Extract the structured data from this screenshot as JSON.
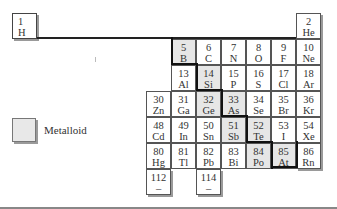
{
  "legend": {
    "label": "Metalloid",
    "color": "#e6e6e6"
  },
  "hydrogen": {
    "number": "1",
    "symbol": "H"
  },
  "elements": [
    {
      "number": "2",
      "symbol": "He",
      "col": 6,
      "row": 0,
      "metalloid": false
    },
    {
      "number": "5",
      "symbol": "B",
      "col": 1,
      "row": 1,
      "metalloid": true
    },
    {
      "number": "6",
      "symbol": "C",
      "col": 2,
      "row": 1,
      "metalloid": false
    },
    {
      "number": "7",
      "symbol": "N",
      "col": 3,
      "row": 1,
      "metalloid": false
    },
    {
      "number": "8",
      "symbol": "O",
      "col": 4,
      "row": 1,
      "metalloid": false
    },
    {
      "number": "9",
      "symbol": "F",
      "col": 5,
      "row": 1,
      "metalloid": false
    },
    {
      "number": "10",
      "symbol": "Ne",
      "col": 6,
      "row": 1,
      "metalloid": false
    },
    {
      "number": "13",
      "symbol": "Al",
      "col": 1,
      "row": 2,
      "metalloid": false
    },
    {
      "number": "14",
      "symbol": "Si",
      "col": 2,
      "row": 2,
      "metalloid": true
    },
    {
      "number": "15",
      "symbol": "P",
      "col": 3,
      "row": 2,
      "metalloid": false
    },
    {
      "number": "16",
      "symbol": "S",
      "col": 4,
      "row": 2,
      "metalloid": false
    },
    {
      "number": "17",
      "symbol": "Cl",
      "col": 5,
      "row": 2,
      "metalloid": false
    },
    {
      "number": "18",
      "symbol": "Ar",
      "col": 6,
      "row": 2,
      "metalloid": false
    },
    {
      "number": "30",
      "symbol": "Zn",
      "col": 0,
      "row": 3,
      "metalloid": false
    },
    {
      "number": "31",
      "symbol": "Ga",
      "col": 1,
      "row": 3,
      "metalloid": false
    },
    {
      "number": "32",
      "symbol": "Ge",
      "col": 2,
      "row": 3,
      "metalloid": true
    },
    {
      "number": "33",
      "symbol": "As",
      "col": 3,
      "row": 3,
      "metalloid": true
    },
    {
      "number": "34",
      "symbol": "Se",
      "col": 4,
      "row": 3,
      "metalloid": false
    },
    {
      "number": "35",
      "symbol": "Br",
      "col": 5,
      "row": 3,
      "metalloid": false
    },
    {
      "number": "36",
      "symbol": "Kr",
      "col": 6,
      "row": 3,
      "metalloid": false
    },
    {
      "number": "48",
      "symbol": "Cd",
      "col": 0,
      "row": 4,
      "metalloid": false
    },
    {
      "number": "49",
      "symbol": "In",
      "col": 1,
      "row": 4,
      "metalloid": false
    },
    {
      "number": "50",
      "symbol": "Sn",
      "col": 2,
      "row": 4,
      "metalloid": false
    },
    {
      "number": "51",
      "symbol": "Sb",
      "col": 3,
      "row": 4,
      "metalloid": true
    },
    {
      "number": "52",
      "symbol": "Te",
      "col": 4,
      "row": 4,
      "metalloid": true
    },
    {
      "number": "53",
      "symbol": "I",
      "col": 5,
      "row": 4,
      "metalloid": false
    },
    {
      "number": "54",
      "symbol": "Xe",
      "col": 6,
      "row": 4,
      "metalloid": false
    },
    {
      "number": "80",
      "symbol": "Hg",
      "col": 0,
      "row": 5,
      "metalloid": false
    },
    {
      "number": "81",
      "symbol": "Tl",
      "col": 1,
      "row": 5,
      "metalloid": false
    },
    {
      "number": "82",
      "symbol": "Pb",
      "col": 2,
      "row": 5,
      "metalloid": false
    },
    {
      "number": "83",
      "symbol": "Bi",
      "col": 3,
      "row": 5,
      "metalloid": false
    },
    {
      "number": "84",
      "symbol": "Po",
      "col": 4,
      "row": 5,
      "metalloid": true
    },
    {
      "number": "85",
      "symbol": "At",
      "col": 5,
      "row": 5,
      "metalloid": true
    },
    {
      "number": "86",
      "symbol": "Rn",
      "col": 6,
      "row": 5,
      "metalloid": false
    },
    {
      "number": "112",
      "symbol": "–",
      "col": 0,
      "row": 6,
      "metalloid": false
    },
    {
      "number": "114",
      "symbol": "–",
      "col": 2,
      "row": 6,
      "metalloid": false
    }
  ]
}
